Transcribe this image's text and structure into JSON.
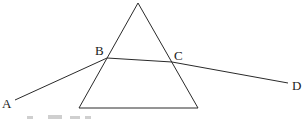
{
  "figure": {
    "type": "prism-refraction-diagram",
    "prism": {
      "apex": [
        138,
        3
      ],
      "base_left": [
        79,
        108
      ],
      "base_right": [
        198,
        108
      ]
    },
    "ray": {
      "points": {
        "A": [
          15,
          100
        ],
        "B": [
          107,
          58
        ],
        "C": [
          172,
          62
        ],
        "D": [
          288,
          83
        ]
      }
    },
    "labels": {
      "A": "A",
      "B": "B",
      "C": "C",
      "D": "D"
    },
    "colors": {
      "line": "#2a2a2a",
      "text": "#1a1a1a",
      "background": "#ffffff"
    }
  }
}
